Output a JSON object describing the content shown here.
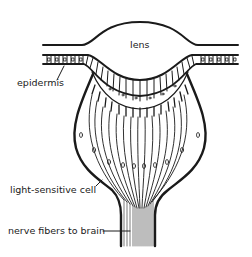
{
  "diagram": {
    "type": "anatomical-cross-section",
    "colors": {
      "ink": "#1a1a1a",
      "background": "#ffffff"
    },
    "labels": {
      "lens": "lens",
      "epidermis": "epidermis",
      "light_sensitive_cell": "light-sensitive cell",
      "nerve_fibers": "nerve fibers to brain"
    },
    "parts": [
      {
        "id": "lens",
        "label": "lens"
      },
      {
        "id": "epidermis",
        "label": "epidermis"
      },
      {
        "id": "light-sensitive-cells",
        "label": "light-sensitive cell"
      },
      {
        "id": "nerve-fibers",
        "label": "nerve fibers to brain"
      }
    ]
  }
}
